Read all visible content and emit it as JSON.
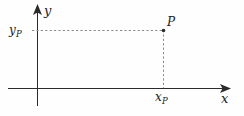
{
  "figure": {
    "type": "coordinate-plane-diagram",
    "background_color": "#fefefe",
    "axis_color": "#2b2b2b",
    "dashed_color": "#8a8a8a",
    "label_color": "#1b1b1b",
    "axes": {
      "x": {
        "label": "x",
        "label_style": "italic",
        "arrow": "right"
      },
      "y": {
        "label": "y",
        "label_style": "italic",
        "arrow": "up"
      },
      "origin_label": ""
    },
    "point": {
      "name": "P",
      "label": "P",
      "x_label": "x",
      "x_subscript": "P",
      "y_label": "y",
      "y_subscript": "P"
    },
    "guides": {
      "horizontal": "dashed",
      "vertical": "dashed"
    }
  }
}
